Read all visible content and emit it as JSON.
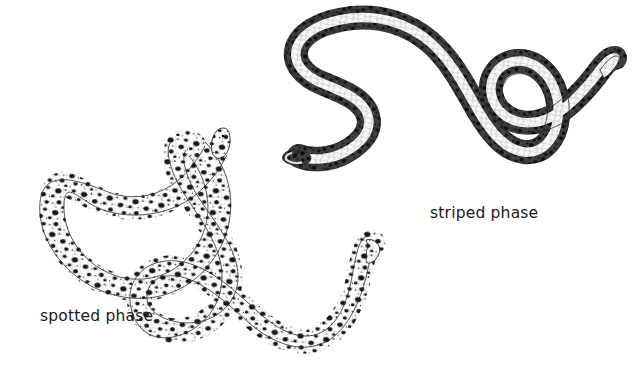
{
  "figure": {
    "type": "scientific-illustration",
    "background_color": "#ffffff",
    "ink_color": "#1a1a1a",
    "width": 644,
    "height": 369,
    "labels": [
      {
        "id": "spotted",
        "text": "spotted phase",
        "x": 40,
        "y": 309
      },
      {
        "id": "striped",
        "text": "striped phase",
        "x": 430,
        "y": 206
      }
    ],
    "specimens": [
      {
        "id": "spotted",
        "name": "spotted phase specimen",
        "pattern": "dark blotches scattered over pale body",
        "position": "lower-left",
        "head_at": "upper-center",
        "tail_at": "right hook"
      },
      {
        "id": "striped",
        "name": "striped phase specimen",
        "pattern": "pale dorsal stripe flanked by dark lateral bands",
        "position": "upper-right",
        "head_at": "left",
        "tail_at": "far right curl"
      }
    ]
  }
}
